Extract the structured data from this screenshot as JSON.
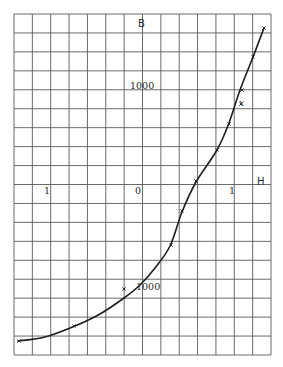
{
  "diagram": {
    "type": "B-H magnetization curve on graph paper",
    "axis_labels": {
      "vertical": "B",
      "horizontal": "H"
    },
    "tick_labels": {
      "upper_b": "1000",
      "lower_b": "1000",
      "left_h": "1",
      "origin": "0",
      "right_h": "1"
    },
    "point_marker_label": "x",
    "colors": {
      "grid": "#5a5a5a",
      "curve": "#1e1e1e",
      "background": "#ffffff",
      "text": "#2a2a2a"
    }
  },
  "chart_data": {
    "type": "line",
    "title": "",
    "xlabel": "H",
    "ylabel": "B",
    "grid": true,
    "grid_columns": 14,
    "grid_rows": 18,
    "tick_labels": [
      "1",
      "0",
      "1",
      "1000",
      "1000"
    ],
    "series": [
      {
        "name": "magnetization curve",
        "points_px": [
          [
            18,
            341
          ],
          [
            45,
            337
          ],
          [
            75,
            326
          ],
          [
            100,
            314
          ],
          [
            124,
            298
          ],
          [
            140,
            285
          ],
          [
            155,
            268
          ],
          [
            170,
            246
          ],
          [
            182,
            212
          ],
          [
            196,
            182
          ],
          [
            217,
            150
          ],
          [
            229,
            123
          ],
          [
            240,
            90
          ],
          [
            253,
            57
          ],
          [
            264,
            28
          ]
        ],
        "markers_px": [
          [
            19,
            341
          ],
          [
            74,
            326
          ],
          [
            124,
            289
          ],
          [
            171,
            245
          ],
          [
            182,
            211
          ],
          [
            196,
            181
          ],
          [
            217,
            150
          ],
          [
            229,
            124
          ],
          [
            241,
            104
          ],
          [
            242,
            90
          ],
          [
            253,
            57
          ],
          [
            264,
            28
          ]
        ]
      }
    ]
  }
}
